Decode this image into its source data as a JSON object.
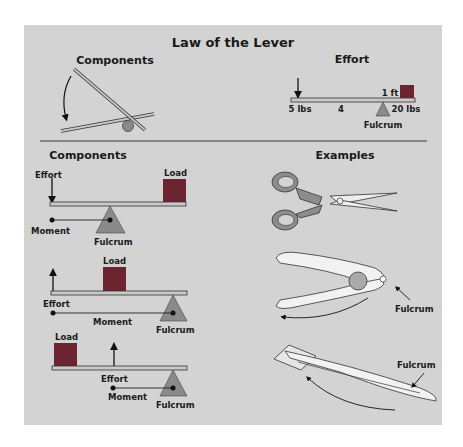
{
  "title": "Law of the Lever",
  "top": {
    "components_heading": "Components",
    "effort_heading": "Effort",
    "effort_diagram": {
      "effort_weight": "5 lbs",
      "effort_distance": "4",
      "load_distance": "1 ft",
      "load_weight": "20 lbs",
      "fulcrum": "Fulcrum"
    }
  },
  "left": {
    "heading": "Components",
    "class1": {
      "effort": "Effort",
      "load": "Load",
      "moment": "Moment",
      "fulcrum": "Fulcrum"
    },
    "class2": {
      "effort": "Effort",
      "load": "Load",
      "moment": "Moment",
      "fulcrum": "Fulcrum"
    },
    "class3": {
      "effort": "Effort",
      "load": "Load",
      "moment": "Moment",
      "fulcrum": "Fulcrum"
    }
  },
  "right": {
    "heading": "Examples",
    "examples": [
      {
        "name": "scissors"
      },
      {
        "name": "nutcracker",
        "label": "Fulcrum"
      },
      {
        "name": "tweezers",
        "label": "Fulcrum"
      }
    ]
  },
  "colors": {
    "panel": "#d3d3d3",
    "load": "#6b2430",
    "fulcrum": "#8a8a8a",
    "beam": "#c9c9c9",
    "handle": "#8c8c8c",
    "outline": "#222222"
  }
}
